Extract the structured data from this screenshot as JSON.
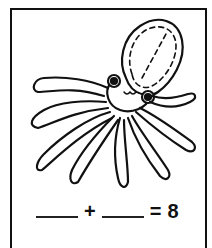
{
  "worksheet": {
    "illustration": "octopus",
    "equation": {
      "blank1": "",
      "operator": "+",
      "blank2": "",
      "equals": "=",
      "result": "8"
    }
  }
}
